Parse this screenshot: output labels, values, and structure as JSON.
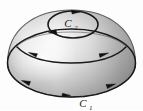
{
  "figure": {
    "name": "oriented-hemisphere-with-boundary-curves",
    "background_color": "#fdfdfd",
    "stroke_color": "#1a1a1a",
    "surface": {
      "name": "hemisphere-dome",
      "highlight_color": "#f2f2f2",
      "midtone_color": "#cfcfcf",
      "shadow_color": "#8f8f8f",
      "edge_color": "#7a7a7a"
    },
    "labels": {
      "c1": {
        "base": "C",
        "sub": "1"
      },
      "c2": {
        "base": "C",
        "sub": "2"
      }
    },
    "curves": [
      {
        "name": "boundary-curve-c1",
        "label": "C1",
        "position": "base-rim",
        "orientation": "counterclockwise-from-above",
        "arrow_count": 3
      },
      {
        "name": "mid-latitude-curve",
        "label": "",
        "position": "mid-dome",
        "orientation": "counterclockwise-from-above",
        "arrow_count": 2
      },
      {
        "name": "boundary-curve-c2",
        "label": "C2",
        "position": "top-circle",
        "orientation": "clockwise-from-above",
        "arrow_count": 2
      }
    ]
  }
}
